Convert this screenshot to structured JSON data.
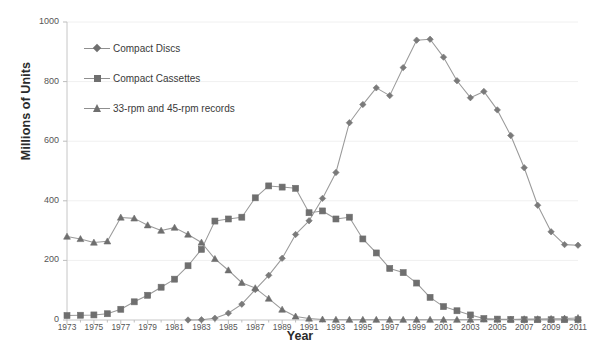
{
  "chart_data": {
    "type": "line",
    "title": "",
    "xlabel": "Year",
    "ylabel": "Millions of Units",
    "xlim": [
      1973,
      2011
    ],
    "ylim": [
      0,
      1000
    ],
    "yticks": [
      0,
      200,
      400,
      600,
      800,
      1000
    ],
    "xticks_labeled": [
      1973,
      1975,
      1977,
      1979,
      1981,
      1983,
      1985,
      1987,
      1989,
      1991,
      1993,
      1995,
      1997,
      1999,
      2001,
      2003,
      2005,
      2007,
      2009,
      2011
    ],
    "x": [
      1973,
      1974,
      1975,
      1976,
      1977,
      1978,
      1979,
      1980,
      1981,
      1982,
      1983,
      1984,
      1985,
      1986,
      1987,
      1988,
      1989,
      1990,
      1991,
      1992,
      1993,
      1994,
      1995,
      1996,
      1997,
      1998,
      1999,
      2000,
      2001,
      2002,
      2003,
      2004,
      2005,
      2006,
      2007,
      2008,
      2009,
      2010,
      2011
    ],
    "grid": false,
    "legend_position": "upper-left-inside",
    "series": [
      {
        "name": "Compact Discs",
        "marker": "diamond",
        "color": "#7a7a7a",
        "values": [
          null,
          null,
          null,
          null,
          null,
          null,
          null,
          null,
          null,
          0,
          1,
          6,
          23,
          53,
          102,
          150,
          207,
          287,
          333,
          408,
          495,
          662,
          723,
          779,
          753,
          847,
          939,
          942,
          882,
          803,
          746,
          767,
          705,
          619,
          511,
          385,
          296,
          253,
          251
        ]
      },
      {
        "name": "Compact Cassettes",
        "marker": "square",
        "color": "#6f6f6f",
        "values": [
          15,
          16,
          17,
          21,
          36,
          61,
          83,
          110,
          137,
          182,
          237,
          332,
          339,
          345,
          410,
          450,
          446,
          442,
          360,
          366,
          339,
          345,
          272,
          225,
          173,
          159,
          124,
          76,
          45,
          31,
          17,
          5,
          3,
          2,
          1,
          1,
          1,
          1,
          1
        ]
      },
      {
        "name": "33-rpm and 45-rpm records",
        "marker": "triangle",
        "color": "#6f6f6f",
        "values": [
          280,
          272,
          260,
          264,
          344,
          341,
          318,
          300,
          310,
          287,
          260,
          205,
          167,
          125,
          107,
          72,
          35,
          12,
          5,
          2,
          1,
          1,
          1,
          1,
          1,
          1,
          1,
          1,
          1,
          1,
          1,
          2,
          2,
          2,
          3,
          3,
          4,
          5,
          7
        ]
      }
    ]
  },
  "legend": {
    "items": [
      {
        "label": "Compact Discs",
        "marker": "diamond"
      },
      {
        "label": "Compact Cassettes",
        "marker": "square"
      },
      {
        "label": "33-rpm and 45-rpm records",
        "marker": "triangle"
      }
    ]
  }
}
